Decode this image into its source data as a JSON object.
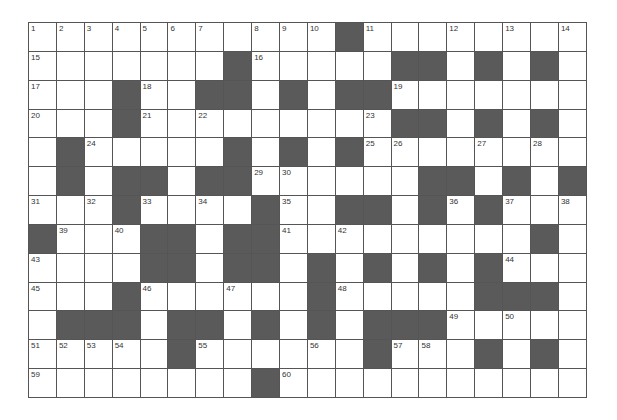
{
  "puzzle": {
    "rows": 13,
    "cols": 20,
    "colors": {
      "block": "#5a5a5a",
      "cell": "#ffffff",
      "line": "#555555",
      "number": "#333333"
    },
    "legend": "# = black square, . = white square, digits = clue number",
    "grid": [
      [
        "1",
        "2",
        "3",
        "4",
        "5",
        "6",
        "7",
        ".",
        "8",
        "9",
        "10",
        "#",
        "11",
        ".",
        ".",
        "12",
        ".",
        "13",
        ".",
        "14"
      ],
      [
        "15",
        ".",
        ".",
        ".",
        ".",
        ".",
        ".",
        "#",
        "16",
        ".",
        ".",
        ".",
        ".",
        "#",
        "#",
        ".",
        "#",
        ".",
        "#",
        "."
      ],
      [
        "17",
        ".",
        ".",
        "#",
        "18",
        ".",
        "#",
        "#",
        ".",
        "#",
        ".",
        "#",
        "#",
        "19",
        ".",
        ".",
        ".",
        ".",
        ".",
        "."
      ],
      [
        "20",
        ".",
        ".",
        "#",
        "21",
        ".",
        "22",
        ".",
        ".",
        ".",
        ".",
        ".",
        "23",
        "#",
        "#",
        ".",
        "#",
        ".",
        "#",
        "."
      ],
      [
        ".",
        "#",
        "24",
        ".",
        ".",
        ".",
        ".",
        "#",
        ".",
        "#",
        ".",
        "#",
        "25",
        "26",
        ".",
        ".",
        "27",
        ".",
        "28",
        "."
      ],
      [
        ".",
        "#",
        ".",
        "#",
        "#",
        ".",
        "#",
        "#",
        "29",
        "30",
        ".",
        ".",
        ".",
        ".",
        "#",
        "#",
        ".",
        "#",
        ".",
        "#"
      ],
      [
        "31",
        ".",
        "32",
        "#",
        "33",
        ".",
        "34",
        ".",
        "#",
        "35",
        ".",
        "#",
        "#",
        ".",
        "#",
        "36",
        "#",
        "37",
        ".",
        "38"
      ],
      [
        "#",
        "39",
        ".",
        "40",
        "#",
        "#",
        ".",
        "#",
        "#",
        "41",
        ".",
        "42",
        ".",
        ".",
        ".",
        ".",
        ".",
        ".",
        "#",
        "."
      ],
      [
        "43",
        ".",
        ".",
        ".",
        "#",
        "#",
        ".",
        "#",
        "#",
        ".",
        "#",
        ".",
        "#",
        ".",
        "#",
        ".",
        "#",
        "44",
        ".",
        "."
      ],
      [
        "45",
        ".",
        ".",
        "#",
        "46",
        ".",
        ".",
        "47",
        ".",
        ".",
        "#",
        "48",
        ".",
        ".",
        ".",
        ".",
        "#",
        "#",
        "#",
        "."
      ],
      [
        ".",
        "#",
        "#",
        "#",
        ".",
        "#",
        "#",
        ".",
        "#",
        ".",
        "#",
        ".",
        "#",
        "#",
        "#",
        "49",
        ".",
        "50",
        ".",
        "."
      ],
      [
        "51",
        "52",
        "53",
        "54",
        ".",
        "#",
        "55",
        ".",
        ".",
        ".",
        "56",
        ".",
        "#",
        "57",
        "58",
        ".",
        "#",
        ".",
        "#",
        "."
      ],
      [
        "59",
        ".",
        ".",
        ".",
        ".",
        ".",
        ".",
        ".",
        "#",
        "60",
        ".",
        ".",
        ".",
        ".",
        ".",
        ".",
        ".",
        ".",
        ".",
        "."
      ]
    ]
  }
}
